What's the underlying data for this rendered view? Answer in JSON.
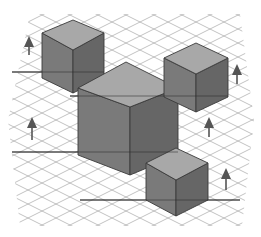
{
  "figure": {
    "title": "",
    "colors": {
      "background": "#ffffff",
      "grid": "#a9a9a9",
      "top_face": "#a8a8a8",
      "left_face": "#7a7a7a",
      "right_face": "#666666",
      "edge": "#3a3a3a",
      "arrow": "#555555"
    },
    "cubes": [
      {
        "id": "cube-top-left",
        "size": "small",
        "top": [
          [
            42,
            33
          ],
          [
            73,
            20
          ],
          [
            104,
            33
          ],
          [
            73,
            50
          ]
        ],
        "bottom_y_sides": 78,
        "bottom_y_center": 93
      },
      {
        "id": "cube-center",
        "size": "large",
        "top": [
          [
            78,
            88
          ],
          [
            126,
            62
          ],
          [
            178,
            88
          ],
          [
            130,
            107
          ]
        ],
        "bottom_y_sides": 155,
        "bottom_y_center": 175
      },
      {
        "id": "cube-right",
        "size": "small",
        "top": [
          [
            164,
            58
          ],
          [
            196,
            43
          ],
          [
            228,
            58
          ],
          [
            196,
            74
          ]
        ],
        "bottom_y_sides": 97,
        "bottom_y_center": 112
      },
      {
        "id": "cube-bottom",
        "size": "small",
        "top": [
          [
            146,
            163
          ],
          [
            176,
            148
          ],
          [
            208,
            163
          ],
          [
            176,
            180
          ]
        ],
        "bottom_y_sides": 200,
        "bottom_y_center": 216
      }
    ],
    "baselines": [
      {
        "x1": 12,
        "y1": 72,
        "x2": 104,
        "y2": 72
      },
      {
        "x1": 70,
        "y1": 96,
        "x2": 228,
        "y2": 96
      },
      {
        "x1": 12,
        "y1": 152,
        "x2": 178,
        "y2": 152
      },
      {
        "x1": 80,
        "y1": 200,
        "x2": 240,
        "y2": 200
      }
    ],
    "arrows": [
      {
        "id": "arrow-1",
        "x": 29,
        "y_tip": 36,
        "y_base": 55
      },
      {
        "id": "arrow-2",
        "x": 237,
        "y_tip": 64,
        "y_base": 84
      },
      {
        "id": "arrow-3",
        "x": 32,
        "y_tip": 117,
        "y_base": 140
      },
      {
        "id": "arrow-4",
        "x": 209,
        "y_tip": 117,
        "y_base": 137
      },
      {
        "id": "arrow-5",
        "x": 226,
        "y_tip": 168,
        "y_base": 190
      }
    ],
    "grid": {
      "x_min": 8,
      "x_max": 252,
      "y_min": 12,
      "y_max": 228,
      "spacing": 14
    }
  }
}
